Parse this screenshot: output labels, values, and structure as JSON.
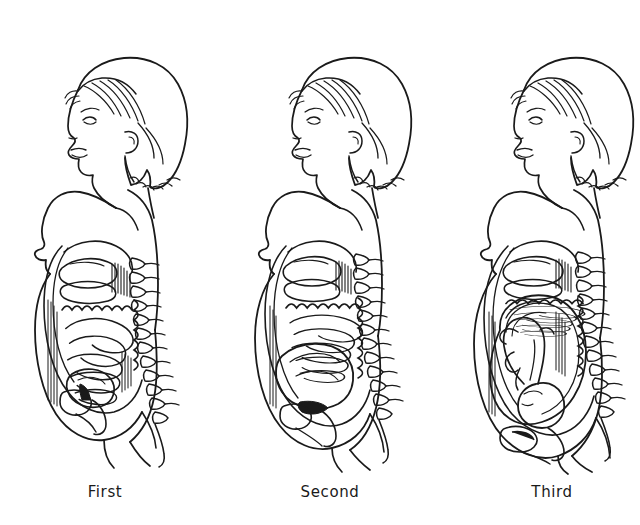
{
  "illustration": {
    "title": "Pregnancy trimesters side profile illustration",
    "style": "black and white line drawing",
    "background_color": "#ffffff",
    "ink_color": "#1a1a1a",
    "width": 640,
    "height": 525
  },
  "captions": [
    {
      "label": "First",
      "x": 105,
      "y": 483,
      "figure": "first-trimester"
    },
    {
      "label": "Second",
      "x": 330,
      "y": 483,
      "figure": "second-trimester"
    },
    {
      "label": "Third",
      "x": 552,
      "y": 483,
      "figure": "third-trimester"
    }
  ],
  "figures": [
    {
      "id": "first-trimester",
      "caption": "First",
      "center_x": 110,
      "belly_scale": 1.0,
      "uterus_size": "small",
      "fetus_visible": false,
      "description": "Woman in profile, first trimester, abdomen showing liver, stomach, coiled small intestine, bladder and small uterus; spine with vertebrae at back."
    },
    {
      "id": "second-trimester",
      "caption": "Second",
      "center_x": 334,
      "belly_scale": 1.18,
      "uterus_size": "medium",
      "fetus_visible": false,
      "description": "Woman in profile, second trimester, enlarged uterus displacing intestines upward; spine with vertebrae at back."
    },
    {
      "id": "third-trimester",
      "caption": "Third",
      "center_x": 556,
      "belly_scale": 1.34,
      "uterus_size": "large",
      "fetus_visible": true,
      "description": "Woman in profile, third trimester, large uterus containing a head-down fetus; intestines compressed upward; spine with vertebrae at back."
    }
  ],
  "anatomy_parts": [
    "hair",
    "face-profile",
    "eye",
    "nose",
    "lips",
    "chin",
    "ear",
    "neck",
    "shoulder",
    "breast",
    "nipple",
    "abdomen-outline",
    "liver",
    "stomach",
    "small-intestine",
    "large-intestine",
    "uterus",
    "bladder",
    "spine",
    "vertebrae",
    "buttock",
    "thigh",
    "fetus-head",
    "fetus-body",
    "fetus-limbs"
  ],
  "artifacts": {
    "top_speckle_line": {
      "present": true,
      "x_start": 300,
      "x_end": 532,
      "y": 3,
      "note": "faint scanner dotted artifact"
    }
  }
}
